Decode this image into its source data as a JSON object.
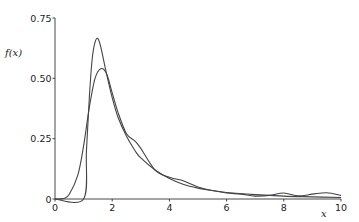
{
  "chart_data": {
    "type": "line",
    "title": "",
    "xlabel": "x",
    "ylabel": "f(x)",
    "xlim": [
      0,
      10
    ],
    "ylim": [
      0,
      0.75
    ],
    "x_ticks": [
      "0",
      "2",
      "4",
      "6",
      "8",
      "10"
    ],
    "y_ticks": [
      "0",
      "0.25",
      "0.50",
      "0.75"
    ],
    "grid": false,
    "legend": null,
    "series": [
      {
        "name": "density curve A (sharp, peaked)",
        "x": [
          0,
          1.0,
          1.1,
          1.2,
          1.3,
          1.4,
          1.5,
          1.6,
          1.8,
          2.0,
          2.2,
          2.5,
          2.8,
          3.0,
          3.5,
          4.0,
          4.5,
          5.0,
          5.5,
          6.0,
          7.0,
          8.0,
          9.0,
          10.0
        ],
        "values": [
          0,
          0,
          0.2,
          0.42,
          0.58,
          0.65,
          0.665,
          0.63,
          0.52,
          0.42,
          0.34,
          0.26,
          0.2,
          0.17,
          0.12,
          0.085,
          0.06,
          0.045,
          0.035,
          0.027,
          0.018,
          0.012,
          0.009,
          0.006
        ]
      },
      {
        "name": "density curve B (smooth, wiggly)",
        "x": [
          0,
          0.3,
          0.5,
          0.8,
          1.0,
          1.2,
          1.4,
          1.6,
          1.8,
          2.0,
          2.2,
          2.5,
          2.8,
          3.0,
          3.5,
          4.0,
          4.5,
          5.0,
          5.5,
          6.0,
          6.5,
          7.0,
          7.5,
          8.0,
          8.5,
          9.0,
          9.5,
          10.0
        ],
        "values": [
          0,
          0.002,
          0.02,
          0.1,
          0.22,
          0.38,
          0.5,
          0.54,
          0.52,
          0.44,
          0.36,
          0.27,
          0.24,
          0.21,
          0.12,
          0.09,
          0.075,
          0.05,
          0.035,
          0.025,
          0.02,
          0.012,
          0.015,
          0.025,
          0.013,
          0.02,
          0.026,
          0.015
        ]
      }
    ]
  }
}
